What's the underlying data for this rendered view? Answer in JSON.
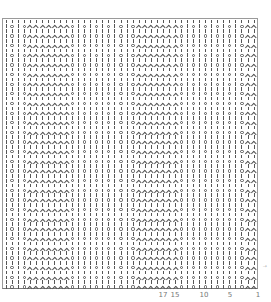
{
  "chart": {
    "type": "knitting-chart",
    "columns": 42,
    "rows": 56,
    "row_types": [
      "plain",
      "pattern"
    ],
    "plain_row": "||||||||||||||||||||||||||||||||||||||||||",
    "pattern_row": "|O|O^^^^^^^O|O|O|O|O|O^^^^^^^O|O|O|O|O|O^^",
    "symbols": {
      "|": "knit-stitch",
      "O": "yarn-over",
      "^": "decrease"
    },
    "colors": {
      "ink": "#555555",
      "border": "#9a9a9a",
      "background": "#ffffff"
    }
  },
  "column_numbers": [
    {
      "label": "17",
      "x": 163
    },
    {
      "label": "15",
      "x": 175
    },
    {
      "label": "10",
      "x": 204
    },
    {
      "label": "5",
      "x": 230
    },
    {
      "label": "1",
      "x": 258
    }
  ],
  "side_label": "↑"
}
